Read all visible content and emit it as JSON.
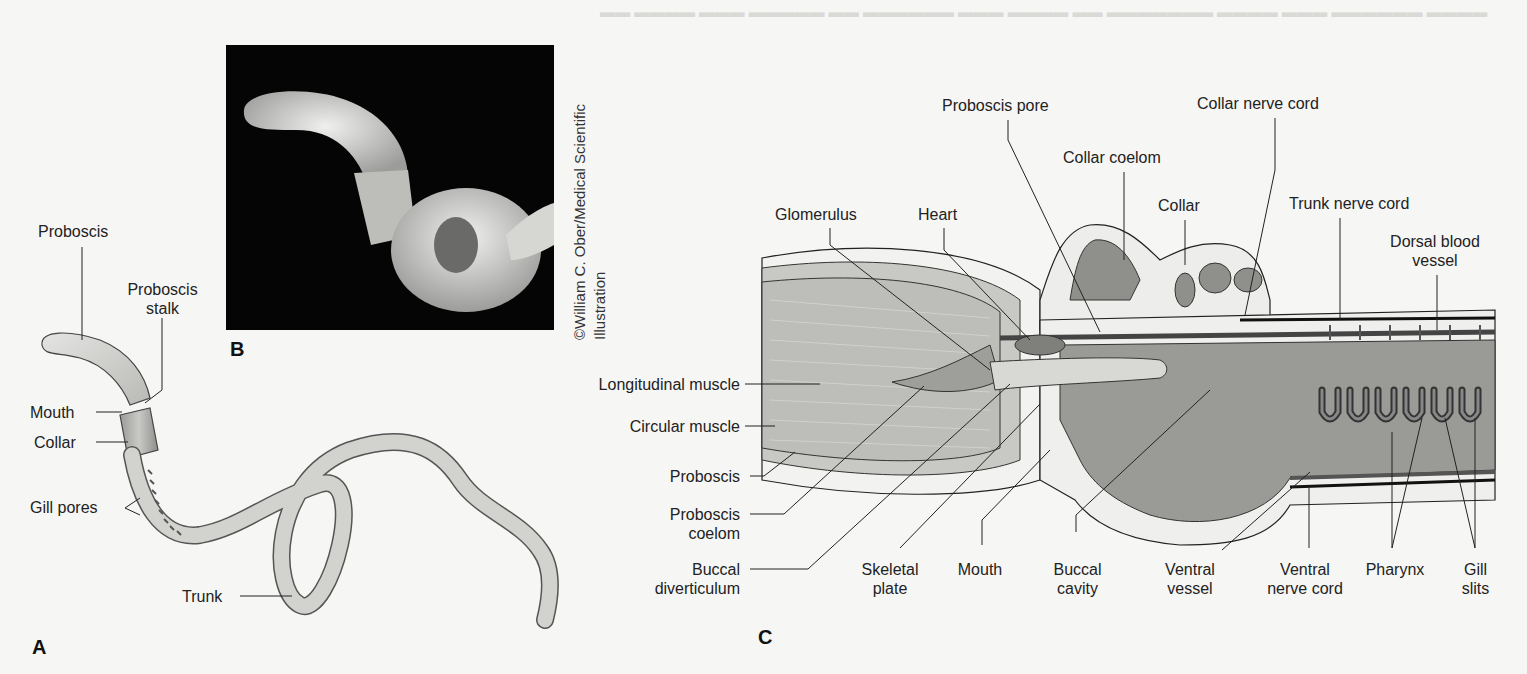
{
  "figure": {
    "panels": {
      "a": "A",
      "b": "B",
      "c": "C"
    },
    "credit": {
      "line1": "©William C. Ober/Medical Scientific",
      "line2": "Illustration"
    },
    "panel_a_labels": {
      "proboscis": "Proboscis",
      "proboscis_stalk_1": "Proboscis",
      "proboscis_stalk_2": "stalk",
      "mouth": "Mouth",
      "collar": "Collar",
      "gill_pores": "Gill pores",
      "trunk": "Trunk"
    },
    "panel_c_labels": {
      "glomerulus": "Glomerulus",
      "heart": "Heart",
      "proboscis_pore": "Proboscis pore",
      "collar_coelom": "Collar coelom",
      "collar_nerve_cord": "Collar nerve cord",
      "collar": "Collar",
      "trunk_nerve_cord": "Trunk nerve cord",
      "dorsal_blood_vessel_1": "Dorsal blood",
      "dorsal_blood_vessel_2": "vessel",
      "longitudinal_muscle": "Longitudinal muscle",
      "circular_muscle": "Circular muscle",
      "proboscis": "Proboscis",
      "proboscis_coelom_1": "Proboscis",
      "proboscis_coelom_2": "coelom",
      "buccal_diverticulum_1": "Buccal",
      "buccal_diverticulum_2": "diverticulum",
      "skeletal_plate_1": "Skeletal",
      "skeletal_plate_2": "plate",
      "mouth": "Mouth",
      "buccal_cavity_1": "Buccal",
      "buccal_cavity_2": "cavity",
      "ventral_vessel_1": "Ventral",
      "ventral_vessel_2": "vessel",
      "ventral_nerve_cord_1": "Ventral",
      "ventral_nerve_cord_2": "nerve cord",
      "pharynx": "Pharynx",
      "gill_slits_1": "Gill",
      "gill_slits_2": "slits"
    }
  }
}
